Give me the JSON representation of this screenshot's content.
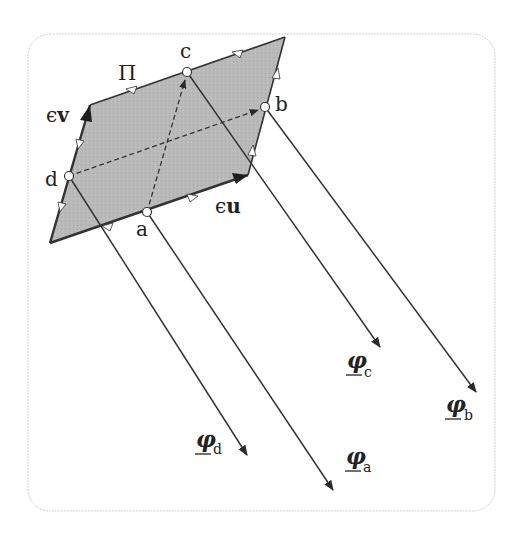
{
  "figure": {
    "frame": {
      "x": 28,
      "y": 34,
      "width": 467,
      "height": 477,
      "radius": 22,
      "stroke": "#c8c8c8"
    },
    "parallelogram": {
      "label": "Π",
      "fill": "#b4b4b4",
      "vertices": [
        [
          50,
          243
        ],
        [
          90,
          105
        ],
        [
          285,
          37
        ],
        [
          248,
          175
        ]
      ]
    },
    "points": {
      "a": {
        "label": "a",
        "x": 147,
        "y": 212
      },
      "b": {
        "label": "b",
        "x": 265,
        "y": 107
      },
      "c": {
        "label": "c",
        "x": 187,
        "y": 72
      },
      "d": {
        "label": "d",
        "x": 69,
        "y": 176
      }
    },
    "vectors": {
      "u": {
        "label_prefix": "ϵ",
        "label_main": "u"
      },
      "v": {
        "label_prefix": "ϵ",
        "label_main": "v"
      }
    },
    "rays": [
      {
        "from": "d",
        "label": "φ",
        "sub": "d",
        "end": [
          247,
          455
        ]
      },
      {
        "from": "a",
        "label": "φ",
        "sub": "a",
        "end": [
          333,
          490
        ]
      },
      {
        "from": "c",
        "label": "φ",
        "sub": "c",
        "end": [
          380,
          347
        ]
      },
      {
        "from": "b",
        "label": "φ",
        "sub": "b",
        "end": [
          476,
          392
        ]
      }
    ],
    "colors": {
      "line": "#333333",
      "arrow": "#222222",
      "frame": "#cccccc",
      "fill": "#b7b7b7"
    }
  }
}
